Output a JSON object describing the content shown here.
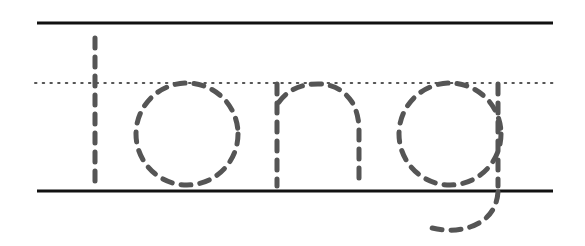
{
  "worksheet": {
    "word": "long",
    "letters": [
      "l",
      "o",
      "n",
      "g"
    ],
    "guide_lines": {
      "top": {
        "style": "solid",
        "y": 23
      },
      "midline": {
        "style": "dotted",
        "y": 83
      },
      "baseline": {
        "style": "solid",
        "y": 191
      }
    },
    "colors": {
      "line": "#111111",
      "dotted_line": "#555555",
      "trace": "#555555",
      "background": "#ffffff"
    }
  }
}
